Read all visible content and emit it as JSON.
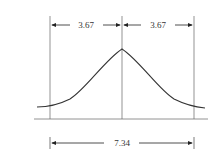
{
  "diagram": {
    "title": "",
    "left_half_width_label": "3.67",
    "right_half_width_label": "3.67",
    "total_width_label": "7.34",
    "colors": {
      "line": "#333333",
      "axis": "#777777",
      "background": "#ffffff"
    }
  }
}
